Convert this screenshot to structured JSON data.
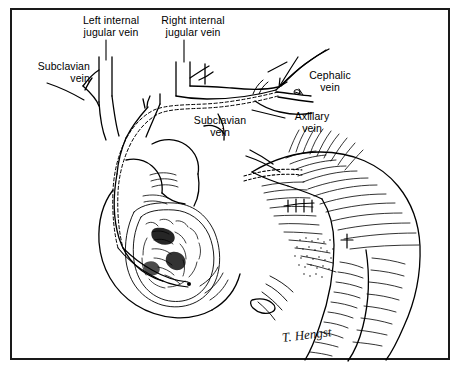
{
  "figure": {
    "background_color": "#ffffff",
    "ink_color": "#000000",
    "frame_color": "#1a1a1a"
  },
  "labels": [
    {
      "id": "subclavian-vein-left",
      "text": "Subclavian\nvein",
      "x": 12,
      "y": 60,
      "align": "left"
    },
    {
      "id": "left-internal-jugular",
      "text": "Left internal\njugular vein",
      "x": 72,
      "y": 14,
      "align": "left"
    },
    {
      "id": "right-internal-jugular",
      "text": "Right internal\njugular vein",
      "x": 157,
      "y": 14,
      "align": "left"
    },
    {
      "id": "subclavian-vein-mid",
      "text": "Subclavian\nvein",
      "x": 195,
      "y": 114,
      "align": "center"
    },
    {
      "id": "cephalic-vein",
      "text": "Cephalic\nvein",
      "x": 304,
      "y": 69,
      "align": "left"
    },
    {
      "id": "axillary-vein",
      "text": "Axillary\nvein",
      "x": 288,
      "y": 110,
      "align": "left"
    }
  ],
  "signature": {
    "text": "T. Hengst",
    "x": 283,
    "y": 345
  },
  "anatomy": {
    "structures": [
      "left internal jugular vein",
      "right internal jugular vein",
      "left subclavian vein",
      "right subclavian vein",
      "superior vena cava",
      "cephalic vein",
      "axillary vein",
      "heart with cutaway right atrium",
      "right shoulder and upper arm"
    ],
    "catheter": {
      "style": "dashed double line",
      "entry": "cephalic vein at deltopectoral groove",
      "route": "cephalic vein to axillary vein to subclavian vein to superior vena cava",
      "tip": "right atrium"
    },
    "markers": [
      {
        "name": "insertion-arrow",
        "description": "arrow pointing to venous cutdown site"
      },
      {
        "name": "incision-marks",
        "description": "surgical incision and suture marks on chest wall"
      },
      {
        "name": "stipple-patch",
        "description": "stippled shading patch over pectoral region"
      }
    ]
  }
}
